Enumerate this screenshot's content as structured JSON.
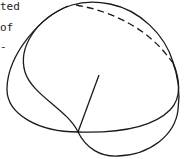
{
  "text_fragments": [
    {
      "id": "line1",
      "text": "ted"
    },
    {
      "id": "line2",
      "text": "of"
    },
    {
      "id": "line3",
      "text": "-"
    }
  ],
  "diagram": {
    "stroke_color": "#1a1a1a",
    "elements": [
      "outer-loop-curve",
      "inner-loop-curve",
      "dashed-arc",
      "spoke-line"
    ]
  }
}
